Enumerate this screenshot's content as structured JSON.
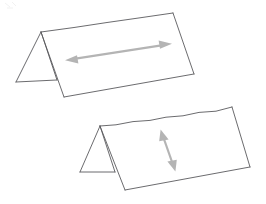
{
  "figure": {
    "canvas": {
      "width": 266,
      "height": 204,
      "background": "#ffffff"
    },
    "palette": {
      "edge_stroke": "#5a5a5e",
      "face_fill": "#ffffff",
      "arrow_gray": "#b4b4b4",
      "smudge_gray": "#ededed"
    },
    "shapes": [
      {
        "id": "upper-prism",
        "label": "upper tent prism",
        "description": "Triangular prism lying on its side, viewed from above-left; left end cap triangle visible",
        "vertices": {
          "ridge_near": [
            41,
            32
          ],
          "ridge_far": [
            173,
            13
          ],
          "base_left_near": [
            16,
            82
          ],
          "base_left_far": [
            148,
            62
          ],
          "base_right_near": [
            64,
            97
          ],
          "base_right_far": [
            194,
            74
          ],
          "triangle_base_right": [
            57,
            80
          ]
        },
        "front_face_points": "41,32 173,13 194,74 64,97",
        "back_slope_points": "41,32 173,13 148,62 16,82",
        "triangle_points": "41,32 16,82 57,80",
        "visible_edges": [
          "41,32 173,13",
          "173,13 194,74",
          "194,74 64,97",
          "64,97 41,32",
          "41,32 16,82",
          "16,82 57,80",
          "57,80 41,32"
        ],
        "dimension_arrow": {
          "name": "length-arrow",
          "orientation": "horizontal",
          "double_headed": true,
          "from": [
            67,
            60
          ],
          "to": [
            170,
            44
          ],
          "color": "#b4b4b4"
        }
      },
      {
        "id": "lower-prism",
        "label": "lower tent prism",
        "description": "Second triangular prism, same orientation, offset down and to the right",
        "vertices": {
          "ridge_near": [
            100,
            126
          ],
          "ridge_far": [
            232,
            107
          ],
          "base_left_near": [
            80,
            172
          ],
          "base_right_near": [
            125,
            190
          ],
          "base_right_far": [
            250,
            167
          ],
          "triangle_base_right": [
            115,
            172
          ]
        },
        "front_face_points": "100,126 232,107 250,167 125,190",
        "triangle_points": "100,126 80,172 115,172",
        "visible_edges": [
          "100,126 232,107",
          "232,107 250,167",
          "250,167 125,190",
          "125,190 100,126",
          "100,126 80,172",
          "80,172 115,172",
          "115,172 100,126"
        ],
        "dimension_arrow": {
          "name": "height-arrow",
          "orientation": "vertical-diagonal",
          "double_headed": true,
          "from": [
            161,
            130
          ],
          "to": [
            175,
            171
          ],
          "color": "#b4b4b4"
        }
      }
    ],
    "artifacts": [
      {
        "id": "corner-smudge",
        "label": "faint scan smudge in top-left corner",
        "bbox": [
          4,
          2,
          18,
          7
        ]
      }
    ]
  }
}
